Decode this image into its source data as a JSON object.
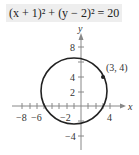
{
  "equation": {
    "text": "(x + 1)² + (y − 2)² = 20"
  },
  "graph": {
    "x_axis_label": "x",
    "y_axis_label": "y",
    "x_tick_labels": [
      "−8",
      "−6",
      "−2",
      "4"
    ],
    "y_tick_labels": [
      "8",
      "4",
      "2",
      "−4"
    ],
    "point_label": "(3, 4)",
    "circle": {
      "center": [
        -1,
        2
      ],
      "radius_squared": 20
    },
    "colors": {
      "curve": "#222222",
      "axis": "#888888",
      "equation_bg": "#eeeeee"
    }
  }
}
